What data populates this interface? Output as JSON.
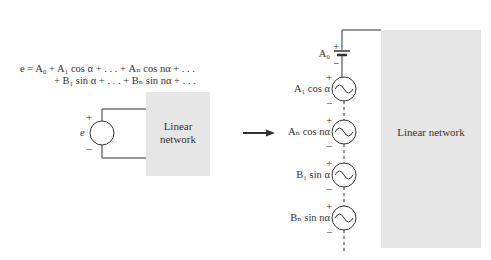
{
  "equation": {
    "line1": "e = A₀ + A₁ cos α + . . . + Aₙ cos nα + . . .",
    "line2": "+ B₁ sin α + . . . + Bₙ sin nα + . . ."
  },
  "left_circuit": {
    "source_label": "e",
    "plus": "+",
    "minus": "−",
    "network_label_line1": "Linear",
    "network_label_line2": "network"
  },
  "right_circuit": {
    "sources": [
      {
        "label": "A₀",
        "type": "dc"
      },
      {
        "label": "A₁ cos α",
        "type": "ac"
      },
      {
        "label": "Aₙ cos nα",
        "type": "ac"
      },
      {
        "label": "B₁ sin α",
        "type": "ac"
      },
      {
        "label": "Bₙ sin nα",
        "type": "ac"
      }
    ],
    "plus": "+",
    "minus": "−",
    "network_label": "Linear network"
  },
  "colors": {
    "network_fill": "#e6e6e6",
    "line": "#333333"
  }
}
